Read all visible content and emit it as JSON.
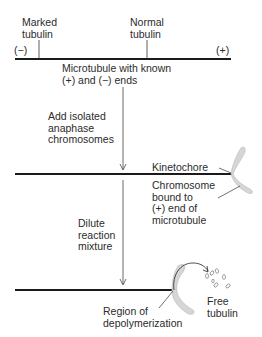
{
  "diagram": {
    "stage1": {
      "marked_label": "Marked\ntubulin",
      "normal_label": "Normal\ntubulin",
      "minus_end": "(−)",
      "plus_end": "(+)",
      "caption": "Microtubule with known\n(+) and (−) ends"
    },
    "step1": {
      "label": "Add isolated\nanaphase\nchromosomes"
    },
    "stage2": {
      "kinetochore_label": "Kinetochore",
      "chromosome_label": "Chromosome\nbound to\n(+) end of\nmicrotubule"
    },
    "step2": {
      "label": "Dilute\nreaction\nmixture"
    },
    "stage3": {
      "region_label": "Region of\ndepolymerization",
      "free_label": "Free\ntubulin"
    },
    "colors": {
      "line": "#1a1a1a",
      "chromosome_fill": "#d6d6d6",
      "chromosome_stroke": "#b5b5b5",
      "text": "#2b2b2b"
    }
  }
}
